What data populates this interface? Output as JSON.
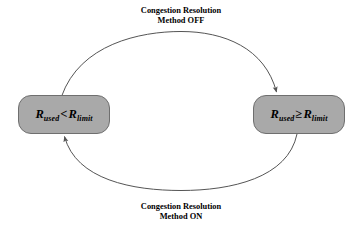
{
  "diagram": {
    "type": "state-transition-diagram",
    "background_color": "#ffffff",
    "node_fill_color": "#a9a9a9",
    "node_border_color": "#6f6f6f",
    "edge_color": "#555555",
    "states": [
      {
        "id": "below-limit",
        "symbol": "R",
        "subscript_left": "used",
        "operator": "<",
        "symbol_right": "R",
        "subscript_right": "limit",
        "full_label": "R_used < R_limit"
      },
      {
        "id": "at-or-above-limit",
        "symbol": "R",
        "subscript_left": "used",
        "operator": "≥",
        "symbol_right": "R",
        "subscript_right": "limit",
        "full_label": "R_used ≥ R_limit"
      }
    ],
    "transitions": [
      {
        "id": "top-transition",
        "from": "below-limit",
        "to": "at-or-above-limit",
        "direction": "left-to-right",
        "label_line1": "Congestion Resolution",
        "label_line2": "Method OFF"
      },
      {
        "id": "bottom-transition",
        "from": "at-or-above-limit",
        "to": "below-limit",
        "direction": "right-to-left",
        "label_line1": "Congestion Resolution",
        "label_line2": "Method ON"
      }
    ]
  }
}
